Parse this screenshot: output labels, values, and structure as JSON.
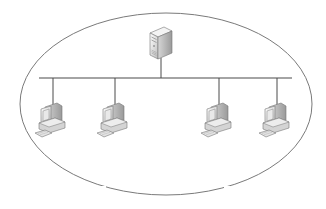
{
  "diagram": {
    "type": "bus-network-topology",
    "boundary": {
      "shape": "ellipse",
      "cx": 166,
      "cy": 104,
      "rx": 146,
      "ry": 91,
      "stroke": "#7a7a7a",
      "gaps_at_bottom": true
    },
    "bus": {
      "x1": 39,
      "x2": 292,
      "y": 78,
      "stroke": "#555555"
    },
    "server": {
      "label": "server",
      "icon": "server-tower-icon",
      "x": 150,
      "y": 28,
      "drop_x": 161
    },
    "workstations": [
      {
        "label": "workstation-1",
        "icon": "desktop-computer-icon",
        "drop_x": 53,
        "x": 33
      },
      {
        "label": "workstation-2",
        "icon": "desktop-computer-icon",
        "drop_x": 115,
        "x": 94
      },
      {
        "label": "workstation-3",
        "icon": "desktop-computer-icon",
        "drop_x": 219,
        "x": 198
      },
      {
        "label": "workstation-4",
        "icon": "desktop-computer-icon",
        "drop_x": 277,
        "x": 256
      }
    ],
    "colors": {
      "device_light": "#f2f2f2",
      "device_mid": "#c8c8c8",
      "device_dark": "#8a8a8a",
      "screen": "#e6e6e6",
      "line": "#4a4a4a"
    }
  }
}
